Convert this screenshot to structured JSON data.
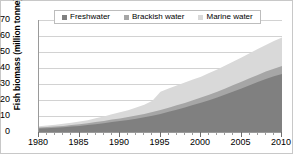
{
  "chart_data": {
    "type": "area",
    "stacked": true,
    "title": "",
    "xlabel": "",
    "ylabel": "Fish biomass (million tonne)",
    "xlim": [
      1980,
      2010
    ],
    "ylim": [
      0,
      70
    ],
    "ytick_labels": [
      "0",
      "10",
      "20",
      "30",
      "40",
      "50",
      "60",
      "70"
    ],
    "ytick_values": [
      0,
      10,
      20,
      30,
      40,
      50,
      60,
      70
    ],
    "xtick_labels": [
      "1980",
      "1985",
      "1990",
      "1995",
      "2000",
      "2005",
      "2010"
    ],
    "xtick_values": [
      1980,
      1985,
      1990,
      1995,
      2000,
      2005,
      2010
    ],
    "xtick_minor_step": 1,
    "grid": "horizontal",
    "legend_position": "top-center",
    "x": [
      1980,
      1981,
      1982,
      1983,
      1984,
      1985,
      1986,
      1987,
      1988,
      1989,
      1990,
      1991,
      1992,
      1993,
      1994,
      1995,
      1996,
      1997,
      1998,
      1999,
      2000,
      2001,
      2002,
      2003,
      2004,
      2005,
      2006,
      2007,
      2008,
      2009,
      2010
    ],
    "series": [
      {
        "name": "Freshwater",
        "color": "#808080",
        "values": [
          2.2,
          2.4,
          2.7,
          3.0,
          3.4,
          3.8,
          4.3,
          4.9,
          5.5,
          6.2,
          6.8,
          7.5,
          8.3,
          9.2,
          10.2,
          11.3,
          12.6,
          13.9,
          15.3,
          16.8,
          18.3,
          19.9,
          21.6,
          23.4,
          25.3,
          27.2,
          29.2,
          31.2,
          33.1,
          34.8,
          36.2
        ]
      },
      {
        "name": "Brackish water",
        "color": "#a6a6a6",
        "values": [
          0.6,
          0.7,
          0.7,
          0.8,
          0.9,
          1.0,
          1.1,
          1.3,
          1.4,
          1.6,
          1.7,
          1.8,
          2.0,
          2.1,
          2.3,
          2.5,
          2.6,
          2.8,
          2.9,
          3.1,
          3.2,
          3.4,
          3.6,
          3.8,
          4.0,
          4.2,
          4.4,
          4.5,
          4.7,
          4.8,
          5.0
        ]
      },
      {
        "name": "Marine water",
        "color": "#d9d9d9",
        "values": [
          0.8,
          0.9,
          1.1,
          1.3,
          1.5,
          1.7,
          2.0,
          2.4,
          2.8,
          3.3,
          3.8,
          4.3,
          5.0,
          5.8,
          7.0,
          11.4,
          12.0,
          12.4,
          12.7,
          12.9,
          13.1,
          13.5,
          13.9,
          14.3,
          14.7,
          15.1,
          15.6,
          16.1,
          16.6,
          17.3,
          17.9
        ]
      }
    ],
    "totals": [
      3.6,
      4.0,
      4.5,
      5.1,
      5.8,
      6.5,
      7.4,
      8.6,
      9.7,
      11.1,
      12.3,
      13.6,
      15.3,
      17.1,
      19.5,
      25.2,
      27.2,
      29.1,
      30.9,
      32.8,
      34.6,
      36.8,
      39.1,
      41.5,
      44.0,
      46.5,
      49.2,
      51.8,
      54.4,
      56.9,
      59.1
    ]
  },
  "legend": {
    "items": [
      {
        "label": "Freshwater"
      },
      {
        "label": "Brackish water"
      },
      {
        "label": "Marine water"
      }
    ]
  }
}
